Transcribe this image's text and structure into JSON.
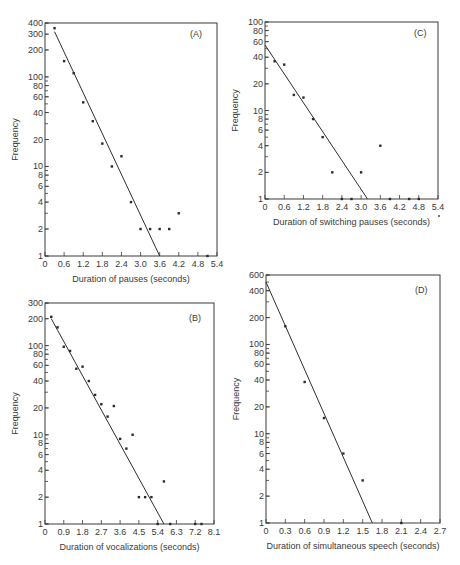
{
  "chart_data": [
    {
      "panel": "A",
      "type": "scatter",
      "title": "(A)",
      "xlabel": "Duration of pauses (seconds)",
      "ylabel": "Frequency",
      "yscale": "log",
      "xlim": [
        0,
        5.4
      ],
      "ylim": [
        1,
        400
      ],
      "xticks": [
        "0",
        "0.6",
        "1.2",
        "1.8",
        "2.4",
        "3.0",
        "3.6",
        "4.2",
        "4.8",
        "5.4"
      ],
      "yticks": [
        "1",
        "2",
        "4",
        "6",
        "8",
        "10",
        "20",
        "40",
        "60",
        "80",
        "100",
        "200",
        "300",
        "400"
      ],
      "points": [
        [
          0.3,
          350
        ],
        [
          0.6,
          150
        ],
        [
          0.9,
          110
        ],
        [
          1.2,
          52
        ],
        [
          1.5,
          32
        ],
        [
          1.8,
          18
        ],
        [
          2.1,
          10
        ],
        [
          2.4,
          13
        ],
        [
          2.7,
          4
        ],
        [
          3.0,
          2
        ],
        [
          3.3,
          2
        ],
        [
          3.6,
          2
        ],
        [
          3.9,
          2
        ],
        [
          4.2,
          3
        ],
        [
          5.1,
          1
        ]
      ],
      "fit_line": [
        [
          0.3,
          320
        ],
        [
          3.6,
          1
        ]
      ],
      "grid": false
    },
    {
      "panel": "C",
      "type": "scatter",
      "title": "(C)",
      "xlabel": "Duration of switching pauses (seconds)",
      "ylabel": "Frequency",
      "yscale": "log",
      "xlim": [
        0,
        5.4
      ],
      "ylim": [
        1,
        100
      ],
      "xticks": [
        "0",
        "0.6",
        "1.2",
        "1.8",
        "2.4",
        "3.0",
        "3.6",
        "4.2",
        "4.8",
        "5.4"
      ],
      "yticks": [
        "1",
        "2",
        "4",
        "6",
        "8",
        "10",
        "20",
        "40",
        "60",
        "80",
        "100"
      ],
      "points": [
        [
          0.3,
          36
        ],
        [
          0.6,
          33
        ],
        [
          0.9,
          15
        ],
        [
          1.2,
          14
        ],
        [
          1.5,
          8
        ],
        [
          1.8,
          5
        ],
        [
          2.1,
          2
        ],
        [
          2.4,
          1
        ],
        [
          2.7,
          1
        ],
        [
          3.0,
          2
        ],
        [
          3.6,
          4
        ],
        [
          3.9,
          1
        ],
        [
          4.5,
          1
        ],
        [
          4.8,
          1
        ]
      ],
      "fit_line": [
        [
          0,
          55
        ],
        [
          3.2,
          1
        ]
      ],
      "grid": false
    },
    {
      "panel": "B",
      "type": "scatter",
      "title": "(B)",
      "xlabel": "Duration of vocalizations (seconds)",
      "ylabel": "Frequency",
      "yscale": "log",
      "xlim": [
        0,
        8.1
      ],
      "ylim": [
        1,
        300
      ],
      "xticks": [
        "0",
        "0.9",
        "1.8",
        "2.7",
        "3.6",
        "4.5",
        "5.4",
        "6.3",
        "7.2",
        "8.1"
      ],
      "yticks": [
        "1",
        "2",
        "4",
        "6",
        "8",
        "10",
        "20",
        "40",
        "60",
        "80",
        "100",
        "200",
        "300"
      ],
      "points": [
        [
          0.3,
          210
        ],
        [
          0.6,
          160
        ],
        [
          0.9,
          97
        ],
        [
          1.2,
          87
        ],
        [
          1.5,
          55
        ],
        [
          1.8,
          58
        ],
        [
          2.1,
          40
        ],
        [
          2.4,
          28
        ],
        [
          2.7,
          22
        ],
        [
          3.0,
          16
        ],
        [
          3.3,
          21
        ],
        [
          3.6,
          9
        ],
        [
          3.9,
          7
        ],
        [
          4.2,
          10
        ],
        [
          4.5,
          2
        ],
        [
          4.8,
          2
        ],
        [
          5.1,
          2
        ],
        [
          5.4,
          1
        ],
        [
          5.7,
          3
        ],
        [
          6.0,
          1
        ],
        [
          7.2,
          1
        ],
        [
          7.5,
          1
        ]
      ],
      "fit_line": [
        [
          0.3,
          200
        ],
        [
          5.7,
          1
        ]
      ],
      "grid": false
    },
    {
      "panel": "D",
      "type": "scatter",
      "title": "(D)",
      "xlabel": "Duration of simultaneous speech (seconds)",
      "ylabel": "Frequency",
      "yscale": "log",
      "xlim": [
        0,
        2.7
      ],
      "ylim": [
        1,
        600
      ],
      "xticks": [
        "0",
        "0.3",
        "0.6",
        "0.9",
        "1.2",
        "1.5",
        "1.8",
        "2.1",
        "2.4",
        "2.7"
      ],
      "yticks": [
        "1",
        "2",
        "4",
        "6",
        "8",
        "10",
        "20",
        "40",
        "60",
        "80",
        "100",
        "200",
        "400",
        "600"
      ],
      "points": [
        [
          0.3,
          160
        ],
        [
          0.6,
          38
        ],
        [
          0.9,
          15
        ],
        [
          1.2,
          6
        ],
        [
          1.5,
          3
        ],
        [
          2.1,
          1
        ]
      ],
      "fit_line": [
        [
          0,
          500
        ],
        [
          1.65,
          1
        ]
      ],
      "grid": false
    }
  ],
  "layout": {
    "A": {
      "x0": 45,
      "x1": 217,
      "y0": 23,
      "y1": 256,
      "tag_x": 190,
      "tag_y": 37
    },
    "C": {
      "x0": 265,
      "x1": 438,
      "y0": 22,
      "y1": 199,
      "tag_x": 414,
      "tag_y": 36
    },
    "B": {
      "x0": 45,
      "x1": 214,
      "y0": 303,
      "y1": 524,
      "tag_x": 189,
      "tag_y": 321
    },
    "D": {
      "x0": 266,
      "x1": 440,
      "y0": 275,
      "y1": 523,
      "tag_x": 415,
      "tag_y": 293
    }
  },
  "labels": {
    "A_ylabel": "Frequency",
    "B_ylabel": "Frequency",
    "C_ylabel": "Frequency",
    "D_ylabel": "Frequency"
  }
}
